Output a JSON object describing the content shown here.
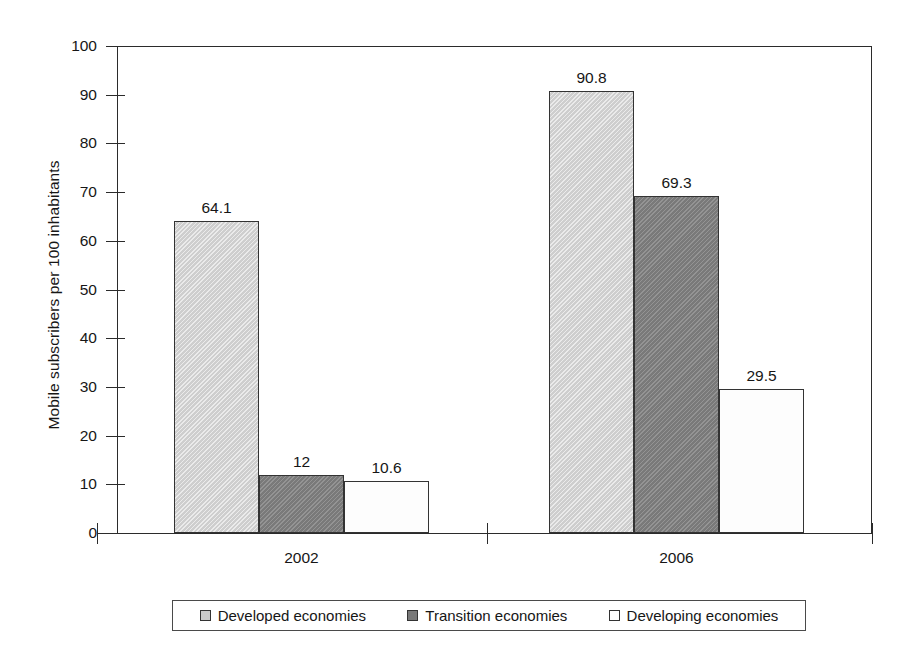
{
  "chart_data": {
    "type": "bar",
    "title": "",
    "subtitle": "",
    "xlabel": "",
    "ylabel": "Mobile subscribers per 100 inhabitants",
    "categories": [
      "2002",
      "2006"
    ],
    "series": [
      {
        "name": "Developed economies",
        "values": [
          64.1,
          90.8
        ],
        "color": "#d2d2d2"
      },
      {
        "name": "Transition economies",
        "values": [
          12,
          69.3
        ],
        "color": "#808080"
      },
      {
        "name": "Developing economies",
        "values": [
          10.6,
          29.5
        ],
        "color": "#fdfdfd"
      }
    ],
    "value_labels": [
      [
        "64.1",
        "12",
        "10.6"
      ],
      [
        "90.8",
        "69.3",
        "29.5"
      ]
    ],
    "ylim": [
      0,
      100
    ],
    "ytick_labels": [
      "0",
      "10",
      "20",
      "30",
      "40",
      "50",
      "60",
      "70",
      "80",
      "90",
      "100"
    ],
    "ytick_values": [
      0,
      10,
      20,
      30,
      40,
      50,
      60,
      70,
      80,
      90,
      100
    ],
    "grid": false,
    "legend_position": "bottom",
    "bar_border_color": "#333333",
    "axis_color": "#2b2b2b"
  },
  "legend": {
    "items": [
      {
        "label": "Developed economies",
        "swatch": "developed"
      },
      {
        "label": "Transition economies",
        "swatch": "transition"
      },
      {
        "label": "Developing economies",
        "swatch": "developing"
      }
    ]
  }
}
